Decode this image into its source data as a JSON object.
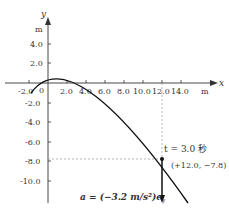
{
  "axes": {
    "x_label": "x",
    "y_label": "y",
    "x_unit": "m",
    "y_unit": "m",
    "origin_label": "0",
    "x_ticks": [
      "-2.0",
      "2.0",
      "4.0",
      "6.0",
      "8.0",
      "10.0",
      "12.0",
      "14.0"
    ],
    "y_ticks": [
      "4.0",
      "2.0",
      "-2.0",
      "-4.0",
      "-6.0",
      "-8.0",
      "-10.0"
    ]
  },
  "annotations": {
    "time_label": "t = 3.0 秒",
    "point_label": "(+12.0, −7.8)",
    "acceleration_label": "a = (−3.2 m/s²)e",
    "acceleration_subscript": "y"
  },
  "colors": {
    "curve": "#111111",
    "axis": "#333333",
    "dashed": "#999999"
  }
}
